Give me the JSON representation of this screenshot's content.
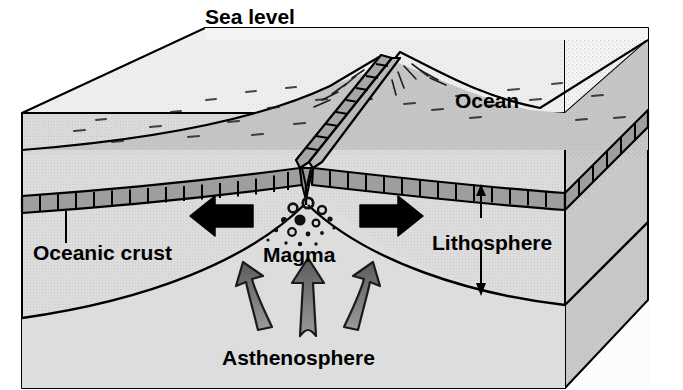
{
  "figure": {
    "type": "cutaway-block-diagram",
    "background_color": "#ffffff",
    "outline_color": "#000000"
  },
  "labels": {
    "sea_level": "Sea level",
    "ocean": "Ocean",
    "oceanic_crust": "Oceanic crust",
    "lithosphere": "Lithosphere",
    "magma": "Magma",
    "asthenosphere": "Asthenosphere"
  },
  "layers": [
    {
      "name": "ocean-water",
      "label": "Ocean",
      "fill": "#efefef"
    },
    {
      "name": "oceanic-crust",
      "label": "Oceanic crust",
      "fill": "#a8a8a8"
    },
    {
      "name": "lithosphere",
      "label": "Lithosphere",
      "fill": "#cfcfcf"
    },
    {
      "name": "asthenosphere",
      "label": "Asthenosphere",
      "fill": "#d9d9d9"
    }
  ],
  "colors": {
    "water_top": "#efefef",
    "water_front": "#e6e6e6",
    "seafloor_top": "#c4c4c4",
    "seafloor_side": "#b5b5b5",
    "crust_band": "#9e9e9e",
    "crust_band_dark": "#8a8a8a",
    "lithosphere_fill": "#d2d2d2",
    "asthenosphere_fill": "#dcdcdc",
    "side_face_dark": "#b0b0b0",
    "spread_arrow": "#000000",
    "convection_arrow": "#6e6e6e",
    "magma_bubble": "#111111",
    "outline": "#000000"
  },
  "arrows": {
    "spreading": [
      {
        "name": "spreading-arrow-left",
        "direction": "left",
        "color": "#000000"
      },
      {
        "name": "spreading-arrow-right",
        "direction": "right",
        "color": "#000000"
      }
    ],
    "convection": [
      {
        "name": "convection-arrow-left",
        "direction": "up-left-curved",
        "color": "#6e6e6e"
      },
      {
        "name": "convection-arrow-center",
        "direction": "up",
        "color": "#6e6e6e"
      },
      {
        "name": "convection-arrow-right",
        "direction": "up-right-curved",
        "color": "#6e6e6e"
      }
    ],
    "lithosphere_thickness": {
      "name": "lithosphere-thickness-arrow",
      "style": "double-headed-vertical",
      "color": "#000000"
    },
    "oceanic_crust_leader": {
      "name": "oceanic-crust-leader-line",
      "style": "leader",
      "color": "#000000"
    }
  },
  "features": {
    "ridge_crest": "mid-ocean ridge with central rift valley",
    "spreading_center": "central axis where magma rises",
    "magma_chamber": "cluster of dark bubbles beneath the ridge axis"
  }
}
